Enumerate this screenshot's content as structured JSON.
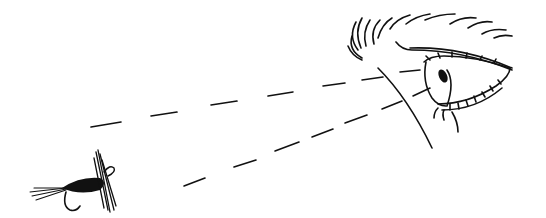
{
  "illustration": {
    "subject": "Eye looking at a fishing fly along two dashed sight lines",
    "style": "black line art on white",
    "colors": {
      "background": "#ffffff",
      "ink": "#111111"
    },
    "elements": [
      "eye",
      "eyebrow",
      "sight-line-upper",
      "sight-line-lower",
      "fishing-fly"
    ]
  }
}
